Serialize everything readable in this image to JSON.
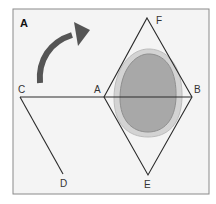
{
  "figure": {
    "panel_label": "A",
    "points": {
      "A": "A",
      "B": "B",
      "C": "C",
      "D": "D",
      "E": "E",
      "F": "F"
    },
    "colors": {
      "frame": "#8a8a8a",
      "background": "#f4f4f4",
      "lines": "#2a2a2a",
      "arrow": "#555555",
      "blob_outer": "#cfcfcf",
      "blob_inner": "#a9a9a9"
    }
  }
}
